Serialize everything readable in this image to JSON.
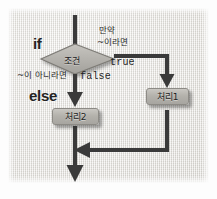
{
  "diagram": {
    "keywords": {
      "if_label": "if",
      "else_label": "else"
    },
    "decision": {
      "shape": "diamond",
      "label": "조건",
      "fill_color": "#b9b7b2",
      "border_color": "#7e7c77"
    },
    "annotations": {
      "true_condition_line1": "만약",
      "true_condition_line2": "~이라면",
      "false_condition": "~이 아니라면"
    },
    "branch_labels": {
      "true_label": "true",
      "false_label": "false"
    },
    "processes": [
      {
        "id": "process-2",
        "label": "처리2",
        "branch": "false"
      },
      {
        "id": "process-1",
        "label": "처리1",
        "branch": "true"
      }
    ],
    "colors": {
      "flow_line": "#3a3a3a",
      "box_fill": "#b8b6b1",
      "box_border": "#8d8b86",
      "paper_bg": "#eceae6",
      "text": "#232323"
    }
  }
}
